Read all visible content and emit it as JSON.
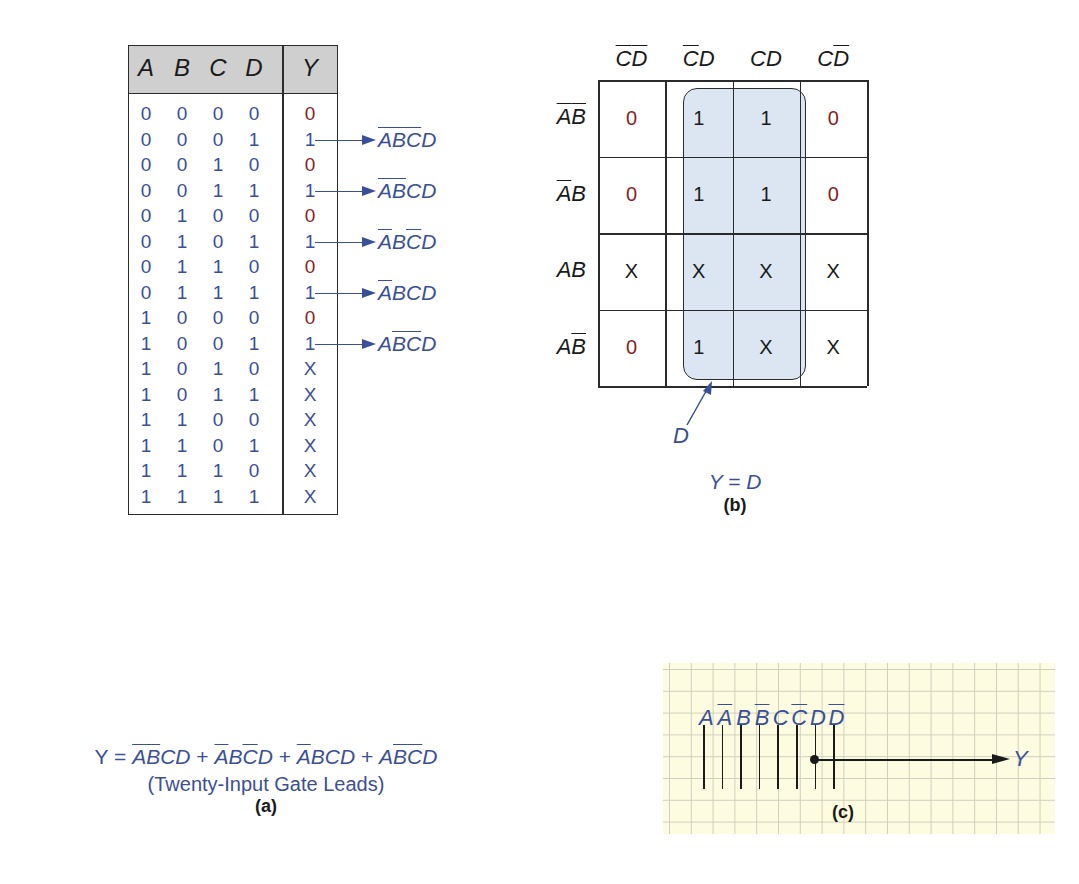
{
  "truth_table": {
    "headers": [
      "A",
      "B",
      "C",
      "D",
      "Y"
    ],
    "rows": [
      {
        "inputs": [
          "0",
          "0",
          "0",
          "0"
        ],
        "y": "0"
      },
      {
        "inputs": [
          "0",
          "0",
          "0",
          "1"
        ],
        "y": "1"
      },
      {
        "inputs": [
          "0",
          "0",
          "1",
          "0"
        ],
        "y": "0"
      },
      {
        "inputs": [
          "0",
          "0",
          "1",
          "1"
        ],
        "y": "1"
      },
      {
        "inputs": [
          "0",
          "1",
          "0",
          "0"
        ],
        "y": "0"
      },
      {
        "inputs": [
          "0",
          "1",
          "0",
          "1"
        ],
        "y": "1"
      },
      {
        "inputs": [
          "0",
          "1",
          "1",
          "0"
        ],
        "y": "0"
      },
      {
        "inputs": [
          "0",
          "1",
          "1",
          "1"
        ],
        "y": "1"
      },
      {
        "inputs": [
          "1",
          "0",
          "0",
          "0"
        ],
        "y": "0"
      },
      {
        "inputs": [
          "1",
          "0",
          "0",
          "1"
        ],
        "y": "1"
      },
      {
        "inputs": [
          "1",
          "0",
          "1",
          "0"
        ],
        "y": "X"
      },
      {
        "inputs": [
          "1",
          "0",
          "1",
          "1"
        ],
        "y": "X"
      },
      {
        "inputs": [
          "1",
          "1",
          "0",
          "0"
        ],
        "y": "X"
      },
      {
        "inputs": [
          "1",
          "1",
          "0",
          "1"
        ],
        "y": "X"
      },
      {
        "inputs": [
          "1",
          "1",
          "1",
          "0"
        ],
        "y": "X"
      },
      {
        "inputs": [
          "1",
          "1",
          "1",
          "1"
        ],
        "y": "X"
      }
    ],
    "minterms": [
      {
        "row": 1,
        "letters": [
          "A",
          "B",
          "C",
          "D"
        ],
        "bar": [
          true,
          true,
          true,
          false
        ]
      },
      {
        "row": 3,
        "letters": [
          "A",
          "B",
          "C",
          "D"
        ],
        "bar": [
          true,
          true,
          false,
          false
        ]
      },
      {
        "row": 5,
        "letters": [
          "A",
          "B",
          "C",
          "D"
        ],
        "bar": [
          true,
          false,
          true,
          false
        ]
      },
      {
        "row": 7,
        "letters": [
          "A",
          "B",
          "C",
          "D"
        ],
        "bar": [
          true,
          false,
          false,
          false
        ]
      },
      {
        "row": 9,
        "letters": [
          "A",
          "B",
          "C",
          "D"
        ],
        "bar": [
          false,
          true,
          true,
          false
        ]
      }
    ]
  },
  "equation_a": {
    "lhs": "Y =",
    "terms": [
      {
        "letters": [
          "A",
          "B",
          "C",
          "D"
        ],
        "bar": [
          true,
          true,
          false,
          false
        ]
      },
      {
        "letters": [
          "A",
          "B",
          "C",
          "D"
        ],
        "bar": [
          true,
          false,
          true,
          false
        ]
      },
      {
        "letters": [
          "A",
          "B",
          "C",
          "D"
        ],
        "bar": [
          true,
          false,
          false,
          false
        ]
      },
      {
        "letters": [
          "A",
          "B",
          "C",
          "D"
        ],
        "bar": [
          false,
          true,
          true,
          false
        ]
      }
    ],
    "separator": " + ",
    "caption": "(Twenty-Input Gate Leads)",
    "label": "(a)"
  },
  "kmap": {
    "col_headers": [
      {
        "letters": [
          "C",
          "D"
        ],
        "bar": [
          true,
          true
        ]
      },
      {
        "letters": [
          "C",
          "D"
        ],
        "bar": [
          true,
          false
        ]
      },
      {
        "letters": [
          "C",
          "D"
        ],
        "bar": [
          false,
          false
        ]
      },
      {
        "letters": [
          "C",
          "D"
        ],
        "bar": [
          false,
          true
        ]
      }
    ],
    "row_headers": [
      {
        "letters": [
          "A",
          "B"
        ],
        "bar": [
          true,
          true
        ]
      },
      {
        "letters": [
          "A",
          "B"
        ],
        "bar": [
          true,
          false
        ]
      },
      {
        "letters": [
          "A",
          "B"
        ],
        "bar": [
          false,
          false
        ]
      },
      {
        "letters": [
          "A",
          "B"
        ],
        "bar": [
          false,
          true
        ]
      }
    ],
    "cells": [
      [
        "0",
        "1",
        "1",
        "0"
      ],
      [
        "0",
        "1",
        "1",
        "0"
      ],
      [
        "X",
        "X",
        "X",
        "X"
      ],
      [
        "0",
        "1",
        "X",
        "X"
      ]
    ],
    "group_label": "D",
    "result": "Y = D",
    "label": "(b)"
  },
  "gate_leads": {
    "inputs": [
      {
        "letter": "A",
        "bar": false
      },
      {
        "letter": "A",
        "bar": true
      },
      {
        "letter": "B",
        "bar": false
      },
      {
        "letter": "B",
        "bar": true
      },
      {
        "letter": "C",
        "bar": false
      },
      {
        "letter": "C",
        "bar": true
      },
      {
        "letter": "D",
        "bar": false
      },
      {
        "letter": "D",
        "bar": true
      }
    ],
    "connected_input": "D",
    "output": "Y",
    "label": "(c)"
  },
  "colors": {
    "blue_text": "#3a4f9a",
    "red_zero": "#8b1e1e",
    "header_gray": "#cfcfcf",
    "group_fill": "#dbe6f2",
    "grid_bg": "#fdfce0"
  }
}
